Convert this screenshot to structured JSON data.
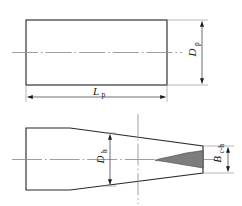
{
  "figure": {
    "background_color": "#ffffff",
    "line_color": "#2b2b2b",
    "centerline_color": "#9a9a9a",
    "shade_color": "#7d7d7d"
  },
  "top_view": {
    "name": "parallel-section-view",
    "dimensions": [
      {
        "id": "Dp",
        "symbol": "D",
        "subscript": "p",
        "orientation": "vertical",
        "meaning": "parallel section diameter"
      },
      {
        "id": "Lp",
        "symbol": "L",
        "subscript": "p",
        "orientation": "horizontal",
        "meaning": "parallel section length"
      }
    ]
  },
  "bottom_view": {
    "name": "tapered-section-view",
    "dimensions": [
      {
        "id": "Dh",
        "symbol": "D",
        "subscript": "h",
        "orientation": "vertical",
        "meaning": "throat diameter"
      },
      {
        "id": "Bch",
        "symbol": "B",
        "subscript": "c-h",
        "orientation": "vertical",
        "meaning": "cone-to-throat width"
      }
    ],
    "features": [
      {
        "id": "wedge",
        "name": "shaded-taper-wedge",
        "fill": "#7d7d7d"
      }
    ]
  }
}
